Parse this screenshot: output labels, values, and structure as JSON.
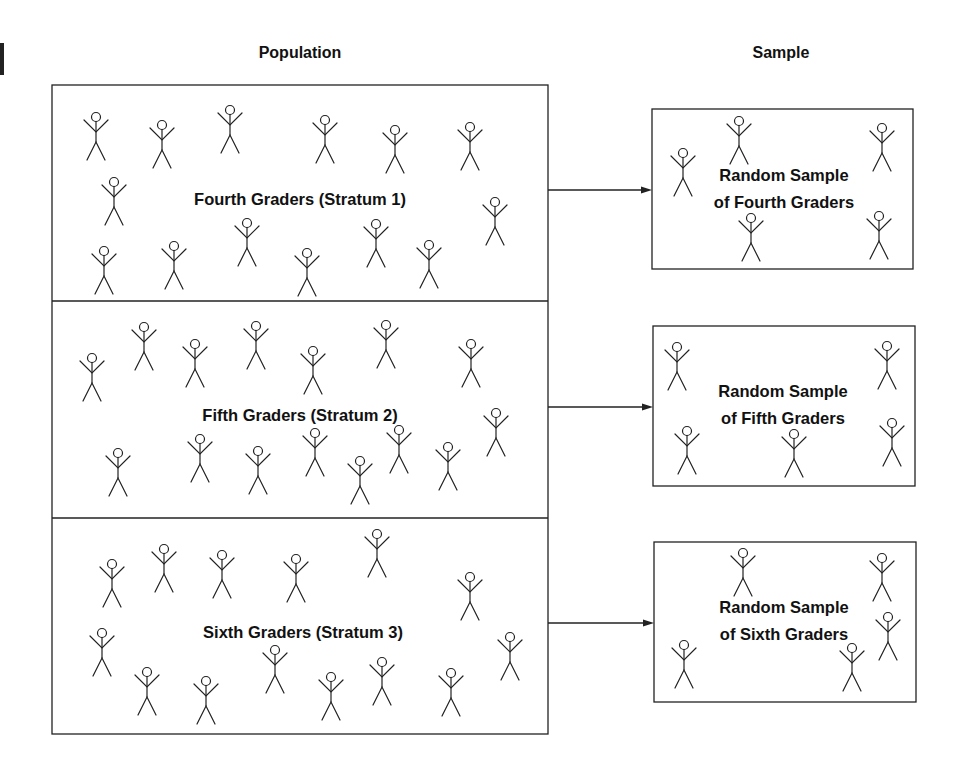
{
  "colors": {
    "stroke": "#222222",
    "text": "#111111",
    "background": "#ffffff"
  },
  "headers": {
    "population": "Population",
    "sample": "Sample"
  },
  "population": {
    "box": {
      "x": 52,
      "y": 85,
      "w": 496,
      "h": 649
    },
    "strata": [
      {
        "label": "Fourth Graders (Stratum 1)",
        "top": 85,
        "bottom": 301,
        "label_pos": {
          "x": 300,
          "y": 199
        },
        "figures": [
          [
            96,
            117
          ],
          [
            162,
            125
          ],
          [
            230,
            110
          ],
          [
            325,
            120
          ],
          [
            395,
            130
          ],
          [
            470,
            127
          ],
          [
            114,
            182
          ],
          [
            495,
            202
          ],
          [
            104,
            251
          ],
          [
            174,
            246
          ],
          [
            247,
            223
          ],
          [
            307,
            253
          ],
          [
            376,
            224
          ],
          [
            429,
            245
          ]
        ]
      },
      {
        "label": "Fifth Graders (Stratum 2)",
        "top": 301,
        "bottom": 518,
        "label_pos": {
          "x": 300,
          "y": 415
        },
        "figures": [
          [
            92,
            358
          ],
          [
            144,
            327
          ],
          [
            195,
            344
          ],
          [
            256,
            326
          ],
          [
            313,
            351
          ],
          [
            386,
            325
          ],
          [
            471,
            344
          ],
          [
            118,
            453
          ],
          [
            200,
            439
          ],
          [
            258,
            451
          ],
          [
            315,
            433
          ],
          [
            360,
            461
          ],
          [
            399,
            430
          ],
          [
            448,
            447
          ],
          [
            496,
            413
          ]
        ]
      },
      {
        "label": "Sixth Graders (Stratum 3)",
        "top": 518,
        "bottom": 734,
        "label_pos": {
          "x": 303,
          "y": 632
        },
        "figures": [
          [
            112,
            564
          ],
          [
            164,
            549
          ],
          [
            222,
            555
          ],
          [
            296,
            559
          ],
          [
            377,
            534
          ],
          [
            470,
            577
          ],
          [
            102,
            633
          ],
          [
            147,
            672
          ],
          [
            206,
            681
          ],
          [
            275,
            650
          ],
          [
            331,
            677
          ],
          [
            382,
            662
          ],
          [
            451,
            673
          ],
          [
            510,
            637
          ]
        ]
      }
    ]
  },
  "samples": [
    {
      "line1": "Random Sample",
      "line2": "of Fourth Graders",
      "box": {
        "x": 652,
        "y": 109,
        "w": 261,
        "h": 160
      },
      "arrow_y": 190,
      "label_pos": {
        "x": 784,
        "y": 189
      },
      "figures": [
        [
          683,
          153
        ],
        [
          739,
          121
        ],
        [
          882,
          128
        ],
        [
          751,
          218
        ],
        [
          879,
          216
        ]
      ]
    },
    {
      "line1": "Random Sample",
      "line2": "of Fifth Graders",
      "box": {
        "x": 653,
        "y": 326,
        "w": 262,
        "h": 160
      },
      "arrow_y": 407,
      "label_pos": {
        "x": 783,
        "y": 405
      },
      "figures": [
        [
          677,
          347
        ],
        [
          887,
          346
        ],
        [
          687,
          431
        ],
        [
          794,
          434
        ],
        [
          892,
          423
        ]
      ]
    },
    {
      "line1": "Random Sample",
      "line2": "of Sixth Graders",
      "box": {
        "x": 654,
        "y": 542,
        "w": 262,
        "h": 160
      },
      "arrow_y": 623,
      "label_pos": {
        "x": 784,
        "y": 621
      },
      "figures": [
        [
          743,
          553
        ],
        [
          882,
          558
        ],
        [
          888,
          617
        ],
        [
          684,
          645
        ],
        [
          852,
          648
        ]
      ]
    }
  ],
  "icons": {
    "figure": "stick-figure-icon",
    "arrow": "arrow-right-icon"
  }
}
